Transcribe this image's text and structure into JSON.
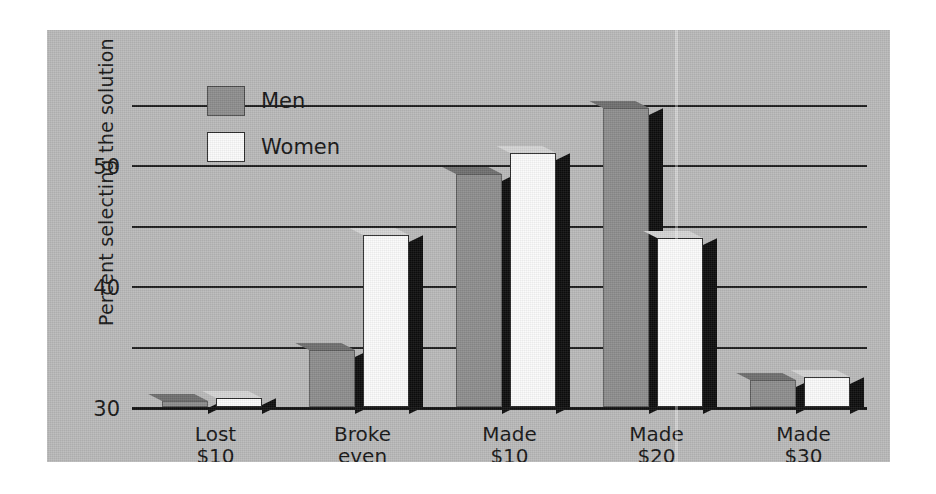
{
  "chart_data": {
    "type": "bar",
    "title": "",
    "subtitle": "",
    "xlabel": "",
    "ylabel": "Percent selecting the solution",
    "ylim": [
      0,
      52
    ],
    "yticks": [
      0,
      10,
      20,
      30,
      40,
      50
    ],
    "ytick_labels": [
      "0",
      "10",
      "20",
      "30",
      "40",
      "50"
    ],
    "grid": true,
    "grid_axis": "y",
    "legend_position": "upper-left-inside",
    "categories": [
      "Lost\n$10",
      "Broke\neven",
      "Made\n$10",
      "Made\n$20",
      "Made\n$30"
    ],
    "category_labels_flat": [
      "Lost $10",
      "Broke even",
      "Made $10",
      "Made $20",
      "Made $30"
    ],
    "series": [
      {
        "name": "Men",
        "color": "#8d8d8d",
        "values": [
          1.0,
          9.5,
          38.5,
          49.5,
          4.5
        ]
      },
      {
        "name": "Women",
        "color": "#fbfbfb",
        "values": [
          1.5,
          28.5,
          42.0,
          28.0,
          5.0
        ]
      }
    ]
  },
  "legend": {
    "items": [
      {
        "label": "Men",
        "swatch": "men"
      },
      {
        "label": "Women",
        "swatch": "women"
      }
    ]
  },
  "colors": {
    "panel_background": "#b9b9b9",
    "page_background": "#ffffff",
    "men_bar": "#8d8d8d",
    "women_bar": "#fbfbfb",
    "bar_shadow": "#0c0c0c",
    "axis_line": "#111111",
    "grid_line": "#1b1b1b",
    "text": "#151515"
  }
}
